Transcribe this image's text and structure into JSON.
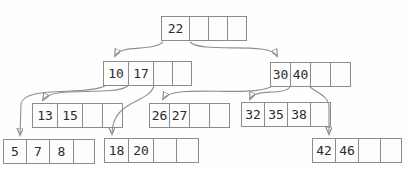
{
  "diagram": {
    "kind": "b-tree",
    "colors": {
      "background": "#fefefe",
      "box_border": "#8c8c8c",
      "arrow_line": "#8f8f8f",
      "arrowhead": "#1e1e1e",
      "text": "#2b2b2b"
    },
    "nodes": [
      {
        "id": "root",
        "level": 0,
        "cells": [
          "22",
          "",
          "",
          ""
        ]
      },
      {
        "id": "node-10-17",
        "level": 1,
        "cells": [
          "10",
          "17",
          "",
          ""
        ]
      },
      {
        "id": "node-30-40",
        "level": 1,
        "cells": [
          "30",
          "40",
          "",
          ""
        ]
      },
      {
        "id": "node-13-15",
        "level": 2,
        "cells": [
          "13",
          "15",
          "",
          ""
        ]
      },
      {
        "id": "node-26-27",
        "level": 2,
        "cells": [
          "26",
          "27",
          "",
          ""
        ]
      },
      {
        "id": "node-32-35-38",
        "level": 2,
        "cells": [
          "32",
          "35",
          "38",
          ""
        ]
      },
      {
        "id": "node-5-7-8",
        "level": 3,
        "cells": [
          "5",
          "7",
          "8",
          ""
        ]
      },
      {
        "id": "node-18-20",
        "level": 3,
        "cells": [
          "18",
          "20",
          "",
          ""
        ]
      },
      {
        "id": "node-42-46",
        "level": 3,
        "cells": [
          "42",
          "46",
          "",
          ""
        ]
      }
    ],
    "edges": [
      {
        "from": "root",
        "pointer": "left-of-22",
        "to": "node-10-17"
      },
      {
        "from": "root",
        "pointer": "right-of-22",
        "to": "node-30-40"
      },
      {
        "from": "node-10-17",
        "pointer": "left-of-10",
        "to": "node-5-7-8"
      },
      {
        "from": "node-10-17",
        "pointer": "between-10-and-17",
        "to": "node-13-15"
      },
      {
        "from": "node-10-17",
        "pointer": "right-of-17",
        "to": "node-18-20"
      },
      {
        "from": "node-30-40",
        "pointer": "left-of-30",
        "to": "node-26-27"
      },
      {
        "from": "node-30-40",
        "pointer": "between-30-and-40",
        "to": "node-32-35-38"
      },
      {
        "from": "node-30-40",
        "pointer": "right-of-40",
        "to": "node-42-46"
      }
    ]
  }
}
